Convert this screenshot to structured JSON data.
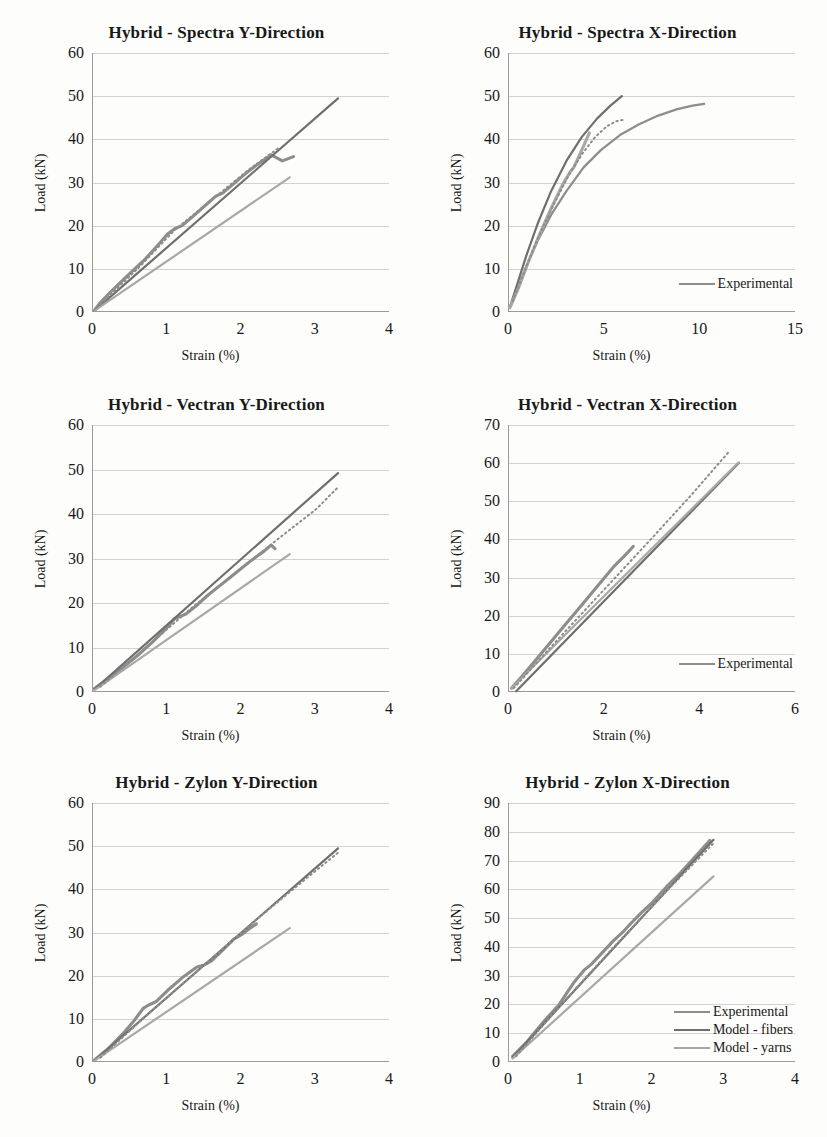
{
  "figure": {
    "xlabel": "Strain (%)",
    "ylabel": "Load (kN)",
    "series_colors": {
      "experimental": "#8d8d8d",
      "model_fibers": "#6f6f6f",
      "model_yarns": "#a8a8a8"
    }
  },
  "chart_data": [
    {
      "type": "line",
      "title": "Hybrid - Spectra Y-Direction",
      "xlabel": "Strain (%)",
      "ylabel": "Load (kN)",
      "xlim": [
        0,
        4
      ],
      "ylim": [
        0,
        60
      ],
      "xticks": [
        "0",
        "1",
        "2",
        "3",
        "4"
      ],
      "yticks": [
        "0",
        "10",
        "20",
        "30",
        "40",
        "50",
        "60"
      ],
      "grid": true,
      "legend": null,
      "series": [
        {
          "name": "Experimental",
          "style": "solid-wavy",
          "x": [
            0.02,
            0.1,
            0.2,
            0.35,
            0.5,
            0.7,
            0.9,
            1.0,
            1.1,
            1.2,
            1.35,
            1.5,
            1.65,
            1.75,
            1.9,
            2.05,
            2.2,
            2.4,
            2.55,
            2.7
          ],
          "y": [
            0.4,
            2.2,
            4.0,
            6.5,
            9.0,
            12.2,
            16.0,
            18.0,
            19.3,
            20.0,
            22.2,
            24.5,
            26.8,
            27.6,
            29.8,
            32.0,
            34.0,
            36.4,
            35.0,
            36.0
          ]
        },
        {
          "name": "Model - fibers",
          "style": "solid",
          "x": [
            0.02,
            3.3
          ],
          "y": [
            0.3,
            49.5
          ]
        },
        {
          "name": "Model - yarns",
          "style": "solid",
          "x": [
            0.02,
            2.65
          ],
          "y": [
            0.3,
            31.2
          ]
        },
        {
          "name": "Experimental-dotted",
          "style": "dotted",
          "x": [
            0.05,
            0.6,
            1.1,
            1.6,
            2.1,
            2.5
          ],
          "y": [
            1.0,
            10.0,
            19.0,
            26.0,
            33.0,
            38.0
          ]
        }
      ]
    },
    {
      "type": "line",
      "title": "Hybrid - Spectra X-Direction",
      "xlabel": "Strain (%)",
      "ylabel": "Load (kN)",
      "xlim": [
        0,
        15
      ],
      "ylim": [
        0,
        60
      ],
      "xticks": [
        "0",
        "5",
        "10",
        "15"
      ],
      "yticks": [
        "0",
        "10",
        "20",
        "30",
        "40",
        "50",
        "60"
      ],
      "grid": true,
      "legend": {
        "position": "inside-right",
        "items": [
          "Experimental"
        ]
      },
      "series": [
        {
          "name": "Experimental",
          "style": "solid",
          "x": [
            0.05,
            0.4,
            0.9,
            1.5,
            2.2,
            3.0,
            3.9,
            4.8,
            5.8,
            6.8,
            7.8,
            8.8,
            9.6,
            10.2
          ],
          "y": [
            1.2,
            5.0,
            10.5,
            16.5,
            22.5,
            28.0,
            33.5,
            37.5,
            41.0,
            43.5,
            45.5,
            47.0,
            47.8,
            48.2
          ]
        },
        {
          "name": "Model - fibers",
          "style": "solid",
          "x": [
            0.05,
            0.4,
            0.9,
            1.5,
            2.2,
            3.0,
            3.8,
            4.6,
            5.3,
            5.9
          ],
          "y": [
            1.2,
            6.0,
            13.0,
            20.5,
            28.0,
            35.0,
            40.5,
            44.8,
            47.8,
            50.0
          ]
        },
        {
          "name": "Model - yarns",
          "style": "solid-wavy",
          "x": [
            0.05,
            0.5,
            1.0,
            1.6,
            2.2,
            2.8,
            3.2,
            3.4,
            3.6,
            3.9,
            4.2
          ],
          "y": [
            1.0,
            5.6,
            11.5,
            18.0,
            24.0,
            29.5,
            32.5,
            33.6,
            35.5,
            38.5,
            41.5
          ]
        },
        {
          "name": "Experimental-dotted",
          "style": "dotted",
          "x": [
            0.2,
            0.9,
            1.6,
            2.4,
            3.1,
            3.8,
            4.5,
            5.1,
            5.6,
            6.1
          ],
          "y": [
            2.5,
            10.5,
            18.0,
            25.5,
            31.5,
            36.5,
            40.5,
            43.0,
            44.2,
            44.6
          ]
        }
      ]
    },
    {
      "type": "line",
      "title": "Hybrid - Vectran Y-Direction",
      "xlabel": "Strain (%)",
      "ylabel": "Load (kN)",
      "xlim": [
        0,
        4
      ],
      "ylim": [
        0,
        60
      ],
      "xticks": [
        "0",
        "1",
        "2",
        "3",
        "4"
      ],
      "yticks": [
        "0",
        "10",
        "20",
        "30",
        "40",
        "50",
        "60"
      ],
      "grid": true,
      "legend": null,
      "series": [
        {
          "name": "Experimental",
          "style": "solid-wavy",
          "x": [
            0.02,
            0.2,
            0.4,
            0.6,
            0.8,
            1.0,
            1.1,
            1.25,
            1.4,
            1.55,
            1.7,
            1.85,
            2.0,
            2.15,
            2.3,
            2.4,
            2.45
          ],
          "y": [
            0.8,
            3.0,
            5.5,
            8.2,
            11.2,
            14.5,
            16.5,
            17.5,
            19.5,
            21.8,
            23.8,
            25.8,
            27.8,
            29.8,
            31.6,
            33.0,
            32.2
          ]
        },
        {
          "name": "Model - fibers",
          "style": "solid",
          "x": [
            0.02,
            3.3
          ],
          "y": [
            0.6,
            49.2
          ]
        },
        {
          "name": "Model - yarns",
          "style": "solid",
          "x": [
            0.02,
            2.65
          ],
          "y": [
            0.4,
            31.0
          ]
        },
        {
          "name": "Experimental-dotted",
          "style": "dotted",
          "x": [
            0.1,
            0.7,
            1.3,
            1.9,
            2.5,
            3.0,
            3.3
          ],
          "y": [
            1.2,
            9.8,
            18.5,
            26.5,
            34.5,
            41.0,
            46.0
          ]
        }
      ]
    },
    {
      "type": "line",
      "title": "Hybrid - Vectran X-Direction",
      "xlabel": "Strain (%)",
      "ylabel": "Load (kN)",
      "xlim": [
        0,
        6
      ],
      "ylim": [
        0,
        70
      ],
      "xticks": [
        "0",
        "2",
        "4",
        "6"
      ],
      "yticks": [
        "0",
        "10",
        "20",
        "30",
        "40",
        "50",
        "60",
        "70"
      ],
      "grid": true,
      "legend": {
        "position": "inside-right",
        "items": [
          "Experimental"
        ]
      },
      "series": [
        {
          "name": "Experimental",
          "style": "solid-wavy",
          "x": [
            0.05,
            0.3,
            0.6,
            0.9,
            1.2,
            1.5,
            1.8,
            2.0,
            2.2,
            2.4,
            2.55,
            2.6
          ],
          "y": [
            1.0,
            4.5,
            9.0,
            13.5,
            18.0,
            22.5,
            27.0,
            30.0,
            33.0,
            35.5,
            37.5,
            38.2
          ]
        },
        {
          "name": "Model - fibers",
          "style": "solid",
          "x": [
            0.15,
            4.8
          ],
          "y": [
            0.2,
            60.0
          ]
        },
        {
          "name": "Model - yarns",
          "style": "solid",
          "x": [
            0.05,
            4.8
          ],
          "y": [
            1.0,
            60.2
          ]
        },
        {
          "name": "Experimental-dotted",
          "style": "dotted",
          "x": [
            0.1,
            1.0,
            2.0,
            3.0,
            3.8,
            4.6
          ],
          "y": [
            1.0,
            13.5,
            27.0,
            40.5,
            51.5,
            63.0
          ]
        }
      ]
    },
    {
      "type": "line",
      "title": "Hybrid - Zylon Y-Direction",
      "xlabel": "Strain (%)",
      "ylabel": "Load (kN)",
      "xlim": [
        0,
        4
      ],
      "ylim": [
        0,
        60
      ],
      "xticks": [
        "0",
        "1",
        "2",
        "3",
        "4"
      ],
      "yticks": [
        "0",
        "10",
        "20",
        "30",
        "40",
        "50",
        "60"
      ],
      "grid": true,
      "legend": null,
      "series": [
        {
          "name": "Experimental",
          "style": "solid-wavy",
          "x": [
            0.02,
            0.2,
            0.4,
            0.55,
            0.68,
            0.75,
            0.85,
            1.0,
            1.2,
            1.4,
            1.5,
            1.6,
            1.75,
            1.9,
            2.0,
            2.1,
            2.2
          ],
          "y": [
            0.5,
            3.0,
            6.5,
            9.5,
            12.5,
            13.2,
            14.0,
            16.5,
            19.5,
            22.0,
            22.5,
            23.5,
            26.0,
            28.5,
            29.5,
            30.8,
            32.0
          ]
        },
        {
          "name": "Model - fibers",
          "style": "solid",
          "x": [
            0.02,
            3.3
          ],
          "y": [
            0.3,
            49.5
          ]
        },
        {
          "name": "Model - yarns",
          "style": "solid",
          "x": [
            0.02,
            2.65
          ],
          "y": [
            0.3,
            31.0
          ]
        },
        {
          "name": "Experimental-dotted",
          "style": "dotted",
          "x": [
            0.1,
            0.8,
            1.5,
            2.2,
            2.8,
            3.3
          ],
          "y": [
            1.0,
            12.0,
            22.5,
            33.0,
            41.5,
            48.5
          ]
        }
      ]
    },
    {
      "type": "line",
      "title": "Hybrid - Zylon X-Direction",
      "xlabel": "Strain (%)",
      "ylabel": "Load (kN)",
      "xlim": [
        0,
        4
      ],
      "ylim": [
        0,
        90
      ],
      "xticks": [
        "0",
        "1",
        "2",
        "3",
        "4"
      ],
      "yticks": [
        "0",
        "10",
        "20",
        "30",
        "40",
        "50",
        "60",
        "70",
        "80",
        "90"
      ],
      "grid": true,
      "legend": {
        "position": "inside-right",
        "items": [
          "Experimental",
          "Model - fibers",
          "Model - yarns"
        ]
      },
      "series": [
        {
          "name": "Experimental",
          "style": "solid-wavy",
          "x": [
            0.05,
            0.25,
            0.5,
            0.7,
            0.9,
            1.05,
            1.15,
            1.3,
            1.45,
            1.6,
            1.75,
            1.85,
            2.0,
            2.2,
            2.4,
            2.6,
            2.8
          ],
          "y": [
            2.0,
            7.0,
            14.5,
            20.0,
            27.5,
            32.0,
            34.0,
            38.0,
            42.0,
            45.5,
            49.5,
            52.0,
            55.5,
            61.0,
            66.0,
            71.5,
            77.0
          ]
        },
        {
          "name": "Model - fibers",
          "style": "solid",
          "x": [
            0.05,
            2.85
          ],
          "y": [
            1.5,
            77.2
          ]
        },
        {
          "name": "Model - yarns",
          "style": "solid",
          "x": [
            0.05,
            2.85
          ],
          "y": [
            1.2,
            64.5
          ]
        },
        {
          "name": "Experimental-dotted",
          "style": "dotted",
          "x": [
            0.1,
            0.8,
            1.5,
            2.2,
            2.85
          ],
          "y": [
            2.0,
            22.0,
            41.0,
            59.5,
            76.0
          ]
        }
      ]
    }
  ]
}
